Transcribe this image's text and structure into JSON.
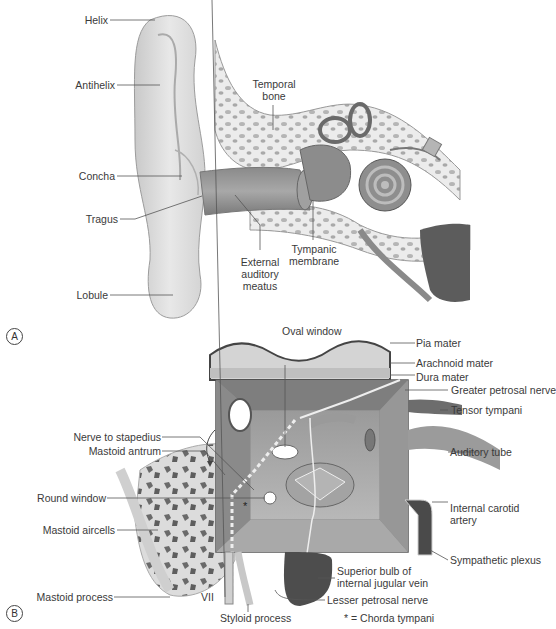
{
  "panel_a": {
    "marker": "A",
    "labels": {
      "helix": "Helix",
      "antihelix": "Antihelix",
      "concha": "Concha",
      "tragus": "Tragus",
      "lobule": "Lobule",
      "temporal_bone_1": "Temporal",
      "temporal_bone_2": "bone",
      "external_auditory_meatus_1": "External",
      "external_auditory_meatus_2": "auditory",
      "external_auditory_meatus_3": "meatus",
      "tympanic_membrane_1": "Tympanic",
      "tympanic_membrane_2": "membrane"
    }
  },
  "panel_b": {
    "marker": "B",
    "labels": {
      "oval_window": "Oval window",
      "pia_mater": "Pia mater",
      "arachnoid_mater": "Arachnoid mater",
      "dura_mater": "Dura mater",
      "greater_petrosal_nerve": "Greater petrosal nerve",
      "tensor_tympani": "Tensor tympani",
      "auditory_tube": "Auditory tube",
      "internal_carotid_artery_1": "Internal carotid",
      "internal_carotid_artery_2": "artery",
      "sympathetic_plexus": "Sympathetic plexus",
      "superior_bulb_1": "Superior bulb of",
      "superior_bulb_2": "internal jugular vein",
      "lesser_petrosal_nerve": "Lesser petrosal nerve",
      "chorda_tympani_note": "* = Chorda tympani",
      "nerve_to_stapedius": "Nerve to stapedius",
      "mastoid_antrum": "Mastoid antrum",
      "round_window": "Round window",
      "mastoid_aircells": "Mastoid aircells",
      "mastoid_process": "Mastoid process",
      "vii": "VII",
      "styloid_process": "Styloid process",
      "asterisk": "*"
    }
  }
}
